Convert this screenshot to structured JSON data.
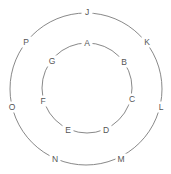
{
  "diagram": {
    "type": "concentric-ring-graph",
    "colors": {
      "line": "#7a7a7a",
      "label": "#555555",
      "background": "#ffffff"
    },
    "inner_ring": {
      "center": [
        87,
        88
      ],
      "radius": 45,
      "nodes": [
        {
          "label": "A",
          "x": 87,
          "y": 43
        },
        {
          "label": "B",
          "x": 124,
          "y": 62
        },
        {
          "label": "C",
          "x": 132,
          "y": 99
        },
        {
          "label": "D",
          "x": 106,
          "y": 130
        },
        {
          "label": "E",
          "x": 68,
          "y": 130
        },
        {
          "label": "F",
          "x": 43,
          "y": 101
        },
        {
          "label": "G",
          "x": 52,
          "y": 61
        }
      ]
    },
    "outer_ring": {
      "center": [
        86,
        89
      ],
      "radius": 76,
      "nodes": [
        {
          "label": "J",
          "x": 87,
          "y": 12
        },
        {
          "label": "K",
          "x": 147,
          "y": 42
        },
        {
          "label": "L",
          "x": 161,
          "y": 107
        },
        {
          "label": "M",
          "x": 121,
          "y": 159
        },
        {
          "label": "N",
          "x": 55,
          "y": 159
        },
        {
          "label": "O",
          "x": 12,
          "y": 107
        },
        {
          "label": "P",
          "x": 26,
          "y": 42
        }
      ]
    }
  }
}
